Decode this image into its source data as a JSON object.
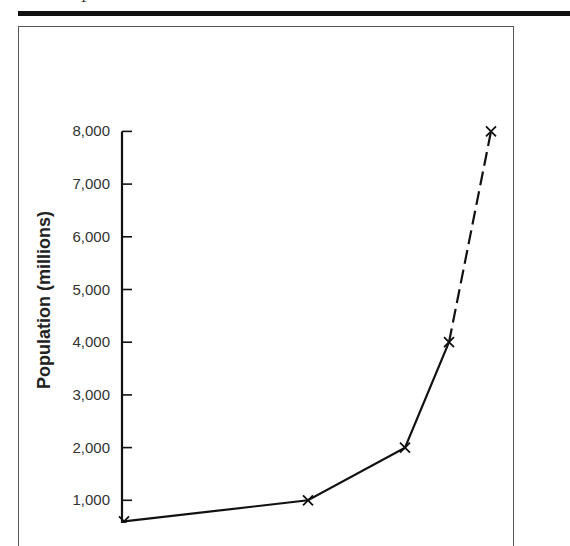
{
  "page": {
    "top_glyph": "1"
  },
  "chart_data": {
    "type": "line",
    "title": "",
    "xlabel": "",
    "ylabel": "Population (millions)",
    "ylim": [
      0,
      8000
    ],
    "yticks": [
      1000,
      2000,
      3000,
      4000,
      5000,
      6000,
      7000,
      8000
    ],
    "ytick_labels": [
      "1,000",
      "2,000",
      "3,000",
      "4,000",
      "5,000",
      "6,000",
      "7,000",
      "8,000"
    ],
    "grid": false,
    "legend": null,
    "marker": "x",
    "series": [
      {
        "name": "World population",
        "style": "solid",
        "points": [
          {
            "x_px": 124,
            "value": 600
          },
          {
            "x_px": 308,
            "value": 1000
          },
          {
            "x_px": 405,
            "value": 2000
          },
          {
            "x_px": 449,
            "value": 4000
          }
        ]
      },
      {
        "name": "Projected",
        "style": "dashed",
        "points": [
          {
            "x_px": 449,
            "value": 4000
          },
          {
            "x_px": 491,
            "value": 8000
          }
        ]
      }
    ],
    "values": [
      600,
      1000,
      2000,
      4000,
      8000
    ],
    "colors": {
      "line": "#111111",
      "axis": "#111111",
      "frame": "#555555",
      "text": "#333333"
    }
  }
}
